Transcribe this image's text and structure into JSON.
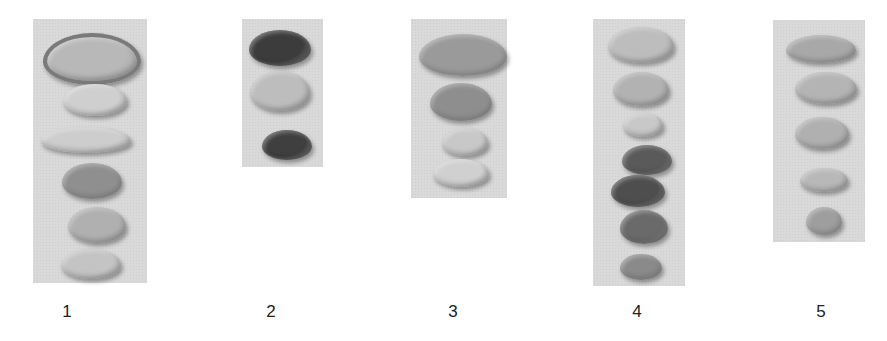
{
  "figure": {
    "panels": [
      {
        "label": "1",
        "x": 33,
        "y": 19,
        "w": 114,
        "h": 264,
        "seeds": [
          {
            "cx": 88,
            "cy": 55,
            "w": 90,
            "h": 44,
            "color": "#b8b8b8",
            "rim": "#7a7a7a"
          },
          {
            "cx": 95,
            "cy": 100,
            "w": 64,
            "h": 32,
            "color": "#cfcfcf"
          },
          {
            "cx": 86,
            "cy": 140,
            "w": 90,
            "h": 26,
            "color": "#cdcdcd"
          },
          {
            "cx": 92,
            "cy": 181,
            "w": 60,
            "h": 36,
            "color": "#8f8f8f"
          },
          {
            "cx": 97,
            "cy": 225,
            "w": 58,
            "h": 36,
            "color": "#b0b0b0"
          },
          {
            "cx": 91,
            "cy": 264,
            "w": 60,
            "h": 30,
            "color": "#c4c4c4"
          }
        ]
      },
      {
        "label": "2",
        "x": 242,
        "y": 19,
        "w": 81,
        "h": 148,
        "seeds": [
          {
            "cx": 280,
            "cy": 48,
            "w": 62,
            "h": 36,
            "color": "#3c3c3c"
          },
          {
            "cx": 280,
            "cy": 91,
            "w": 60,
            "h": 40,
            "color": "#bdbdbd"
          },
          {
            "cx": 287,
            "cy": 145,
            "w": 50,
            "h": 30,
            "color": "#3f3f3f"
          }
        ]
      },
      {
        "label": "3",
        "x": 411,
        "y": 19,
        "w": 96,
        "h": 179,
        "seeds": [
          {
            "cx": 463,
            "cy": 55,
            "w": 88,
            "h": 42,
            "color": "#9a9a9a"
          },
          {
            "cx": 461,
            "cy": 102,
            "w": 62,
            "h": 38,
            "color": "#8e8e8e"
          },
          {
            "cx": 465,
            "cy": 142,
            "w": 46,
            "h": 28,
            "color": "#c8c8c8"
          },
          {
            "cx": 461,
            "cy": 173,
            "w": 56,
            "h": 28,
            "color": "#d0d0d0"
          }
        ]
      },
      {
        "label": "4",
        "x": 593,
        "y": 19,
        "w": 92,
        "h": 267,
        "seeds": [
          {
            "cx": 641,
            "cy": 45,
            "w": 66,
            "h": 36,
            "color": "#bdbdbd"
          },
          {
            "cx": 641,
            "cy": 89,
            "w": 56,
            "h": 34,
            "color": "#b2b2b2"
          },
          {
            "cx": 643,
            "cy": 125,
            "w": 40,
            "h": 24,
            "color": "#c8c8c8"
          },
          {
            "cx": 647,
            "cy": 160,
            "w": 50,
            "h": 30,
            "color": "#5a5a5a"
          },
          {
            "cx": 638,
            "cy": 191,
            "w": 54,
            "h": 32,
            "color": "#4e4e4e"
          },
          {
            "cx": 644,
            "cy": 227,
            "w": 48,
            "h": 34,
            "color": "#6a6a6a"
          },
          {
            "cx": 641,
            "cy": 267,
            "w": 42,
            "h": 26,
            "color": "#8a8a8a"
          }
        ]
      },
      {
        "label": "5",
        "x": 773,
        "y": 20,
        "w": 92,
        "h": 222,
        "seeds": [
          {
            "cx": 821,
            "cy": 49,
            "w": 70,
            "h": 28,
            "color": "#a8a8a8"
          },
          {
            "cx": 826,
            "cy": 88,
            "w": 62,
            "h": 32,
            "color": "#b4b4b4"
          },
          {
            "cx": 822,
            "cy": 133,
            "w": 54,
            "h": 32,
            "color": "#b0b0b0"
          },
          {
            "cx": 824,
            "cy": 180,
            "w": 48,
            "h": 24,
            "color": "#b8b8b8"
          },
          {
            "cx": 824,
            "cy": 221,
            "w": 36,
            "h": 28,
            "color": "#9e9e9e"
          }
        ]
      }
    ],
    "labels": [
      {
        "text": "1",
        "x": 67
      },
      {
        "text": "2",
        "x": 271
      },
      {
        "text": "3",
        "x": 453
      },
      {
        "text": "4",
        "x": 637
      },
      {
        "text": "5",
        "x": 821
      }
    ]
  }
}
